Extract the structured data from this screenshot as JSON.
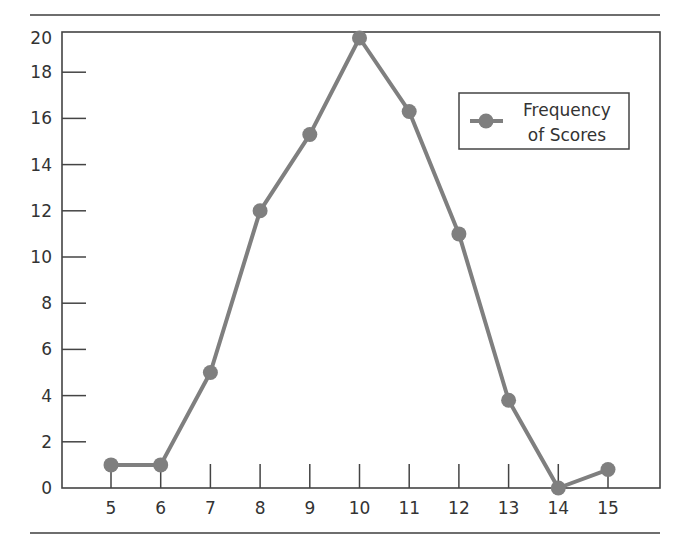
{
  "title_partial": "",
  "chart_data": {
    "type": "line",
    "title": "",
    "xlabel": "",
    "ylabel": "",
    "x": [
      5,
      6,
      7,
      8,
      9,
      10,
      11,
      12,
      13,
      14,
      15
    ],
    "series": [
      {
        "name": "Frequency of Scores",
        "values": [
          1,
          1,
          5,
          12,
          15.3,
          20,
          16.3,
          11,
          3.8,
          0,
          0.8
        ],
        "color": "#7f7f7f"
      }
    ],
    "xticks": [
      "5",
      "6",
      "7",
      "8",
      "9",
      "10",
      "11",
      "12",
      "13",
      "14",
      "15"
    ],
    "yticks": [
      "0",
      "2",
      "4",
      "6",
      "8",
      "10",
      "12",
      "14",
      "16",
      "18",
      "20"
    ],
    "ylim": [
      0,
      20
    ],
    "grid": false,
    "legend_position": "upper right",
    "legend": [
      "Frequency",
      "of Scores"
    ]
  },
  "style": {
    "line_color": "#7f7f7f",
    "axis_color": "#444444"
  }
}
